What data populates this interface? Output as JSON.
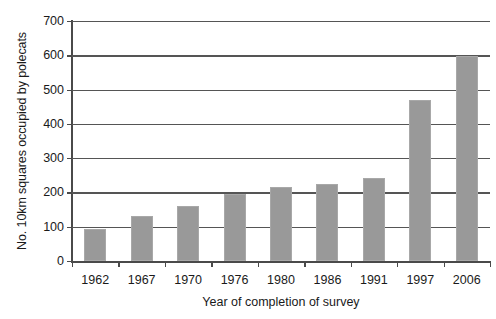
{
  "chart_data": {
    "type": "bar",
    "title": "",
    "xlabel": "Year of completion of survey",
    "ylabel": "No. 10km squares occupied by polecats",
    "categories": [
      "1962",
      "1967",
      "1970",
      "1976",
      "1980",
      "1986",
      "1991",
      "1997",
      "2006"
    ],
    "values": [
      92,
      130,
      160,
      196,
      215,
      226,
      241,
      471,
      597
    ],
    "ylim": [
      0,
      700
    ],
    "yticks": [
      0,
      100,
      200,
      300,
      400,
      500,
      600,
      700
    ],
    "ytick_labels": [
      "0",
      "100",
      "200",
      "300",
      "400",
      "500",
      "600",
      "700"
    ],
    "grid": true,
    "legend": "none",
    "series": [
      {
        "name": "No. 10km squares occupied by polecats",
        "values": [
          92,
          130,
          160,
          196,
          215,
          226,
          241,
          471,
          597
        ]
      }
    ],
    "colors": {
      "bar_fill": "#999999",
      "bar_edge": "#a8a8a8",
      "gridline": "#555555",
      "axis": "#4a4a4a",
      "text": "#1a1a1a",
      "background": "#ffffff"
    }
  }
}
